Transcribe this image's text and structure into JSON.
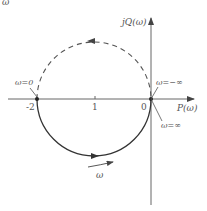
{
  "figure": {
    "corner_fragment": "ω",
    "axes": {
      "x_label": "P(ω)",
      "y_label": "jQ(ω)",
      "ticks": [
        {
          "label": "-2",
          "value": -2
        },
        {
          "label": "1",
          "value": -1
        },
        {
          "label": "0",
          "value": 0
        }
      ]
    },
    "annotations": {
      "omega_zero": "ω=0",
      "omega_neg_inf": "ω=−∞",
      "omega_pos_inf": "ω=∞",
      "omega_direction": "ω"
    },
    "curves": [
      {
        "name": "upper-semicircle",
        "style": "dashed",
        "direction": "counterclockwise (right to left)",
        "range": "ω from −∞ to 0"
      },
      {
        "name": "lower-semicircle",
        "style": "solid",
        "direction": "left to right",
        "range": "ω from 0 to ∞"
      }
    ],
    "colors": {
      "line": "#444444",
      "text": "#555555",
      "axis": "#666666"
    }
  }
}
